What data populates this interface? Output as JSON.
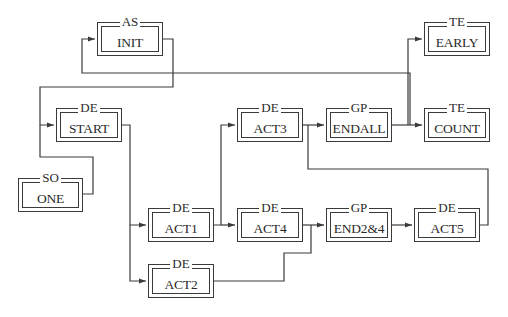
{
  "diagram": {
    "type": "block-flow",
    "colors": {
      "line": "#3a3a3a",
      "background": "#ffffff",
      "text": "#2a2a2a"
    },
    "nodes": [
      {
        "id": "init",
        "type": "AS",
        "name": "INIT",
        "x": 97,
        "y": 22,
        "w": 66,
        "h": 34
      },
      {
        "id": "start",
        "type": "DE",
        "name": "START",
        "x": 56,
        "y": 108,
        "w": 66,
        "h": 34
      },
      {
        "id": "one",
        "type": "SO",
        "name": "ONE",
        "x": 18,
        "y": 178,
        "w": 65,
        "h": 34
      },
      {
        "id": "act3",
        "type": "DE",
        "name": "ACT3",
        "x": 237,
        "y": 108,
        "w": 66,
        "h": 34
      },
      {
        "id": "endall",
        "type": "GP",
        "name": "ENDALL",
        "x": 326,
        "y": 108,
        "w": 66,
        "h": 34
      },
      {
        "id": "early",
        "type": "TE",
        "name": "EARLY",
        "x": 424,
        "y": 22,
        "w": 66,
        "h": 34
      },
      {
        "id": "count",
        "type": "TE",
        "name": "COUNT",
        "x": 424,
        "y": 108,
        "w": 66,
        "h": 34
      },
      {
        "id": "act1",
        "type": "DE",
        "name": "ACT1",
        "x": 148,
        "y": 208,
        "w": 66,
        "h": 34
      },
      {
        "id": "act4",
        "type": "DE",
        "name": "ACT4",
        "x": 237,
        "y": 208,
        "w": 66,
        "h": 34
      },
      {
        "id": "end24",
        "type": "GP",
        "name": "END2&4",
        "x": 326,
        "y": 208,
        "w": 66,
        "h": 34
      },
      {
        "id": "act5",
        "type": "DE",
        "name": "ACT5",
        "x": 414,
        "y": 208,
        "w": 66,
        "h": 34
      },
      {
        "id": "act2",
        "type": "DE",
        "name": "ACT2",
        "x": 148,
        "y": 264,
        "w": 66,
        "h": 34
      }
    ],
    "edges": [
      {
        "from": "init",
        "to": "start",
        "points": "163,39 173,39 173,87 40,87 40,125 54,125"
      },
      {
        "from": "endall",
        "to": "init",
        "points": "410,125 410,73 82,73 82,39 95,39",
        "gap": [
          171,
          175
        ]
      },
      {
        "from": "one",
        "to": "start",
        "points": "83,194 93,194 93,157 40,157 40,125"
      },
      {
        "from": "start",
        "to": "act1",
        "points": "122,125 130,125 130,225 146,225"
      },
      {
        "from": "start",
        "to": "act2",
        "points": "130,225 130,281 146,281"
      },
      {
        "from": "act1",
        "to": "act3",
        "points": "214,225 221,225 221,125 235,125"
      },
      {
        "from": "act1",
        "to": "act4",
        "points": "221,225 235,225"
      },
      {
        "from": "act3",
        "to": "endall",
        "points": "303,125 324,125"
      },
      {
        "from": "act5",
        "to": "act3",
        "points": "480,225 488,225 488,169 308,169 308,125"
      },
      {
        "from": "act4",
        "to": "end24",
        "points": "303,225 324,225"
      },
      {
        "from": "act2",
        "to": "end24",
        "points": "214,281 284,281 284,253 311,253 311,225"
      },
      {
        "from": "end24",
        "to": "act5",
        "points": "392,225 412,225"
      },
      {
        "from": "endall",
        "to": "count",
        "points": "392,125 422,125"
      },
      {
        "from": "endall",
        "to": "early",
        "points": "408,125 408,39 422,39"
      }
    ],
    "arrowheads": [
      {
        "x": 95,
        "y": 39
      },
      {
        "x": 54,
        "y": 125
      },
      {
        "x": 146,
        "y": 225
      },
      {
        "x": 146,
        "y": 281
      },
      {
        "x": 235,
        "y": 125
      },
      {
        "x": 235,
        "y": 225
      },
      {
        "x": 324,
        "y": 125
      },
      {
        "x": 324,
        "y": 225
      },
      {
        "x": 412,
        "y": 225
      },
      {
        "x": 422,
        "y": 125
      },
      {
        "x": 422,
        "y": 39
      }
    ]
  }
}
